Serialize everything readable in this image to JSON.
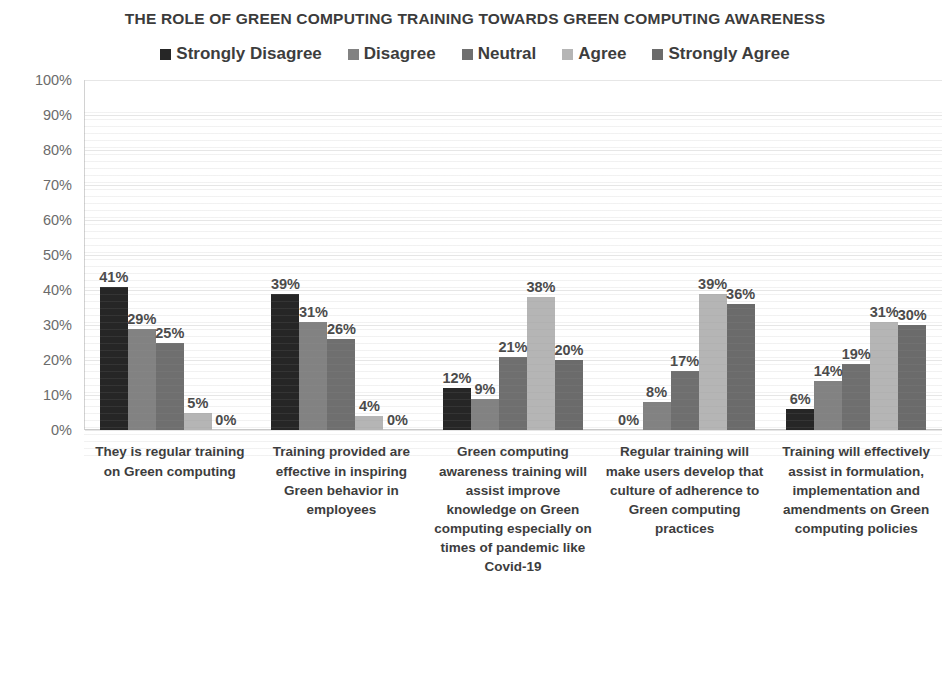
{
  "chart_data": {
    "type": "bar",
    "title": "THE ROLE OF GREEN COMPUTING TRAINING TOWARDS GREEN COMPUTING AWARENESS",
    "xlabel": "",
    "ylabel": "",
    "ylim": [
      0,
      100
    ],
    "ytick_labels": [
      "100%",
      "90%",
      "80%",
      "70%",
      "60%",
      "50%",
      "40%",
      "30%",
      "20%",
      "10%",
      "0%"
    ],
    "ytick_values": [
      100,
      90,
      80,
      70,
      60,
      50,
      40,
      30,
      20,
      10,
      0
    ],
    "grid": true,
    "legend_position": "top",
    "value_label_suffix": "%",
    "categories": [
      "They is regular training on Green computing",
      "Training provided are effective in inspiring Green behavior in employees",
      "Green computing awareness training will assist improve knowledge on Green computing especially on times of pandemic like Covid-19",
      "Regular training will make users develop that culture of adherence to Green computing practices",
      "Training will effectively assist in formulation, implementation and amendments on Green computing policies"
    ],
    "series": [
      {
        "name": "Strongly Disagree",
        "color": "#262626",
        "values": [
          41,
          39,
          12,
          0,
          6
        ],
        "labels": [
          "41%",
          "39%",
          "12%",
          "0%",
          "6%"
        ]
      },
      {
        "name": "Disagree",
        "color": "#828282",
        "values": [
          29,
          31,
          9,
          8,
          14
        ],
        "labels": [
          "29%",
          "31%",
          "9%",
          "8%",
          "14%"
        ]
      },
      {
        "name": "Neutral",
        "color": "#6f6f6f",
        "values": [
          25,
          26,
          21,
          17,
          19
        ],
        "labels": [
          "25%",
          "26%",
          "21%",
          "17%",
          "19%"
        ]
      },
      {
        "name": "Agree",
        "color": "#b5b5b5",
        "values": [
          5,
          4,
          38,
          39,
          31
        ],
        "labels": [
          "5%",
          "4%",
          "38%",
          "39%",
          "31%"
        ]
      },
      {
        "name": "Strongly Agree",
        "color": "#6b6b6b",
        "values": [
          0,
          0,
          20,
          36,
          30
        ],
        "labels": [
          "0%",
          "0%",
          "20%",
          "36%",
          "30%"
        ]
      }
    ]
  }
}
